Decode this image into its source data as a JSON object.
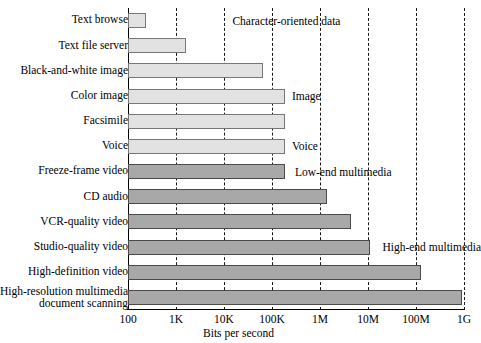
{
  "chart_data": {
    "type": "bar",
    "orientation": "horizontal",
    "title": "",
    "xlabel": "Bits per second",
    "ylabel": "",
    "xscale": "log",
    "xlim": [
      100,
      1000000000
    ],
    "grid": "vertical-dashed",
    "legend": "none",
    "xticks": [
      {
        "label": "100",
        "value": 100
      },
      {
        "label": "1K",
        "value": 1000
      },
      {
        "label": "10K",
        "value": 10000
      },
      {
        "label": "100K",
        "value": 100000
      },
      {
        "label": "1M",
        "value": 1000000
      },
      {
        "label": "10M",
        "value": 10000000
      },
      {
        "label": "100M",
        "value": 100000000
      },
      {
        "label": "1G",
        "value": 1000000000
      }
    ],
    "categories": [
      "Text browse",
      "Text file server",
      "Black-and-white image",
      "Color image",
      "Facsimile",
      "Voice",
      "Freeze-frame video",
      "CD audio",
      "VCR-quality video",
      "Studio-quality video",
      "High-definition video",
      "High-resolution multimedia document scanning"
    ],
    "values": [
      240,
      1600,
      64000,
      190000,
      190000,
      190000,
      190000,
      1400000,
      4500000,
      11000000,
      130000000,
      900000000
    ],
    "bars": [
      {
        "category": "Text browse",
        "label_lines": [
          "Text browse"
        ],
        "value": 240,
        "group": "character-oriented",
        "shade": "light"
      },
      {
        "category": "Text file server",
        "label_lines": [
          "Text file server"
        ],
        "value": 1600,
        "group": "character-oriented",
        "shade": "light"
      },
      {
        "category": "Black-and-white image",
        "label_lines": [
          "Black-and-white image"
        ],
        "value": 64000,
        "group": "image",
        "shade": "light"
      },
      {
        "category": "Color image",
        "label_lines": [
          "Color image"
        ],
        "value": 190000,
        "group": "image",
        "shade": "light"
      },
      {
        "category": "Facsimile",
        "label_lines": [
          "Facsimile"
        ],
        "value": 190000,
        "group": "image",
        "shade": "light"
      },
      {
        "category": "Voice",
        "label_lines": [
          "Voice"
        ],
        "value": 190000,
        "group": "voice",
        "shade": "light"
      },
      {
        "category": "Freeze-frame video",
        "label_lines": [
          "Freeze-frame video"
        ],
        "value": 190000,
        "group": "low-end-multimedia",
        "shade": "dark"
      },
      {
        "category": "CD audio",
        "label_lines": [
          "CD audio"
        ],
        "value": 1400000,
        "group": "low-end-multimedia",
        "shade": "dark"
      },
      {
        "category": "VCR-quality video",
        "label_lines": [
          "VCR-quality video"
        ],
        "value": 4500000,
        "group": "low-end-multimedia",
        "shade": "dark"
      },
      {
        "category": "Studio-quality video",
        "label_lines": [
          "Studio-quality video"
        ],
        "value": 11000000,
        "group": "high-end-multimedia",
        "shade": "dark"
      },
      {
        "category": "High-definition video",
        "label_lines": [
          "High-definition video"
        ],
        "value": 130000000,
        "group": "high-end-multimedia",
        "shade": "dark"
      },
      {
        "category": "High-resolution multimedia document scanning",
        "label_lines": [
          "High-resolution multimedia",
          "document scanning"
        ],
        "value": 900000000,
        "group": "high-end-multimedia",
        "shade": "dark"
      }
    ],
    "annotations": [
      {
        "text": "Character-oriented data",
        "x_value": 15000,
        "row": 0
      },
      {
        "text": "Image",
        "x_value": 260000,
        "row": 3
      },
      {
        "text": "Voice",
        "x_value": 260000,
        "row": 5
      },
      {
        "text": "Low-end multimedia",
        "x_value": 300000,
        "row": 6
      },
      {
        "text": "High-end multimedia",
        "x_value": 20000000,
        "row": 9
      }
    ]
  },
  "colors": {
    "bar_light_fill": "#e2e2e2",
    "bar_light_stroke": "#777777",
    "bar_dark_fill": "#a8a8a8",
    "bar_dark_stroke": "#4a4a4a",
    "axis": "#000000",
    "grid": "#1a1a1a",
    "background": "#ffffff",
    "text": "#000000"
  }
}
